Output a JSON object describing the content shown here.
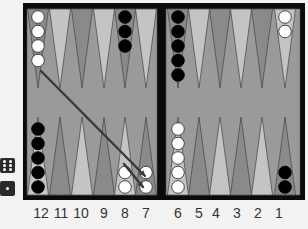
{
  "board": {
    "frame_color": "#0a0a0a",
    "felt_color": "#9a9a9a",
    "point_light": "#c4c4c4",
    "point_dark": "#8a8a8a",
    "bar_color": "#0a0a0a"
  },
  "point_labels": [
    "12",
    "11",
    "10",
    "9",
    "8",
    "7",
    "6",
    "5",
    "4",
    "3",
    "2",
    "1"
  ],
  "dice": [
    {
      "value": 6,
      "name": "die-six"
    },
    {
      "value": 1,
      "name": "die-one"
    }
  ],
  "checkers": {
    "top": [
      {
        "point": 13,
        "color": "white",
        "count": 4
      },
      {
        "point": 17,
        "color": "black",
        "count": 3
      },
      {
        "point": 19,
        "color": "black",
        "count": 5
      },
      {
        "point": 24,
        "color": "white",
        "count": 2
      }
    ],
    "bottom": [
      {
        "point": 12,
        "color": "black",
        "count": 5
      },
      {
        "point": 8,
        "color": "white",
        "count": 2
      },
      {
        "point": 7,
        "color": "white",
        "count": 2
      },
      {
        "point": 6,
        "color": "white",
        "count": 5
      },
      {
        "point": 1,
        "color": "black",
        "count": 2
      }
    ]
  },
  "moves": [
    {
      "from": 13,
      "to": 7,
      "label": "move-13-7"
    },
    {
      "from": 8,
      "to": 7,
      "label": "move-8-7"
    }
  ]
}
